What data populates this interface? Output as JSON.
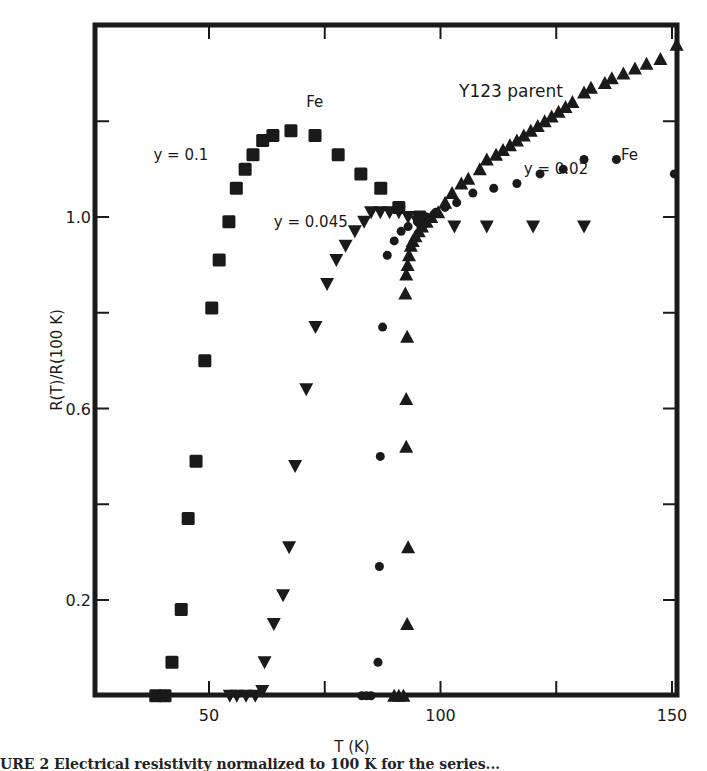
{
  "chart_data": {
    "type": "scatter",
    "title": "",
    "xlabel": "T (K)",
    "xlabel_italic_part": "T",
    "xlabel_unit": "(K)",
    "ylabel": "R(T)/R(100 K)",
    "xlim": [
      25,
      152
    ],
    "ylim": [
      0.0,
      1.45
    ],
    "x_ticks": [
      50,
      75,
      100,
      125,
      150
    ],
    "x_tick_labels": [
      "50",
      "",
      "100",
      "",
      "150"
    ],
    "y_ticks": [
      0.2,
      0.4,
      0.6,
      0.8,
      1.0,
      1.2
    ],
    "y_tick_labels": [
      "0.2",
      "",
      "0.6",
      "",
      "1.0",
      ""
    ],
    "grid": false,
    "legend": "inline annotations",
    "annotations": [
      {
        "text": "Fe",
        "T": 71,
        "R": 1.23
      },
      {
        "text": "y = 0.1",
        "T": 38,
        "R": 1.12
      },
      {
        "text": "y = 0.045",
        "T": 64,
        "R": 0.98
      },
      {
        "text": "Y123 parent",
        "T": 104,
        "R": 1.25
      },
      {
        "text": "y = 0.02",
        "T": 118,
        "R": 1.09
      },
      {
        "text": "Fe",
        "T": 139,
        "R": 1.12
      }
    ],
    "series": [
      {
        "name": "y = 0.1 Fe",
        "marker": "square",
        "points": [
          [
            38.5,
            0.0
          ],
          [
            40.5,
            0.0
          ],
          [
            42.0,
            0.07
          ],
          [
            44.0,
            0.18
          ],
          [
            45.5,
            0.37
          ],
          [
            47.2,
            0.49
          ],
          [
            49.1,
            0.7
          ],
          [
            50.6,
            0.81
          ],
          [
            52.2,
            0.91
          ],
          [
            54.3,
            0.99
          ],
          [
            55.9,
            1.06
          ],
          [
            57.8,
            1.1
          ],
          [
            59.5,
            1.13
          ],
          [
            61.6,
            1.16
          ],
          [
            63.8,
            1.17
          ],
          [
            67.7,
            1.18
          ],
          [
            72.9,
            1.17
          ],
          [
            77.9,
            1.13
          ],
          [
            82.8,
            1.09
          ],
          [
            87.1,
            1.06
          ],
          [
            91.0,
            1.02
          ],
          [
            95.5,
            1.0
          ]
        ]
      },
      {
        "name": "y = 0.045 Fe",
        "marker": "triangle-down",
        "points": [
          [
            54.5,
            0.0
          ],
          [
            56.0,
            0.0
          ],
          [
            58.0,
            0.0
          ],
          [
            60.0,
            0.0
          ],
          [
            61.5,
            0.01
          ],
          [
            62.0,
            0.07
          ],
          [
            64.0,
            0.15
          ],
          [
            66.0,
            0.21
          ],
          [
            67.3,
            0.31
          ],
          [
            68.6,
            0.48
          ],
          [
            71.0,
            0.64
          ],
          [
            73.0,
            0.77
          ],
          [
            75.5,
            0.86
          ],
          [
            77.5,
            0.91
          ],
          [
            79.5,
            0.94
          ],
          [
            81.5,
            0.97
          ],
          [
            83.5,
            0.99
          ],
          [
            85.0,
            1.01
          ],
          [
            87.0,
            1.01
          ],
          [
            89.0,
            1.01
          ],
          [
            91.0,
            1.01
          ],
          [
            93.0,
            1.0
          ],
          [
            95.0,
            0.99
          ],
          [
            97.0,
            0.99
          ],
          [
            103.0,
            0.98
          ],
          [
            110.0,
            0.98
          ],
          [
            120.0,
            0.98
          ],
          [
            131.0,
            0.98
          ]
        ]
      },
      {
        "name": "y = 0.02 Fe",
        "marker": "circle",
        "points": [
          [
            83.0,
            0.0
          ],
          [
            84.0,
            0.0
          ],
          [
            85.0,
            0.0
          ],
          [
            86.5,
            0.07
          ],
          [
            86.8,
            0.27
          ],
          [
            87.0,
            0.5
          ],
          [
            87.5,
            0.77
          ],
          [
            88.5,
            0.92
          ],
          [
            90.0,
            0.95
          ],
          [
            91.5,
            0.97
          ],
          [
            93.0,
            0.98
          ],
          [
            95.0,
            0.99
          ],
          [
            97.0,
            1.0
          ],
          [
            99.0,
            1.01
          ],
          [
            101.0,
            1.02
          ],
          [
            103.5,
            1.03
          ],
          [
            107.0,
            1.05
          ],
          [
            111.5,
            1.06
          ],
          [
            116.5,
            1.07
          ],
          [
            121.5,
            1.09
          ],
          [
            126.5,
            1.1
          ],
          [
            131.0,
            1.12
          ],
          [
            138.0,
            1.12
          ],
          [
            150.5,
            1.09
          ]
        ]
      },
      {
        "name": "Y123 parent",
        "marker": "triangle-up",
        "points": [
          [
            90.0,
            0.0
          ],
          [
            91.0,
            0.0
          ],
          [
            92.0,
            0.0
          ],
          [
            92.8,
            0.15
          ],
          [
            93.0,
            0.31
          ],
          [
            92.6,
            0.52
          ],
          [
            92.6,
            0.62
          ],
          [
            92.8,
            0.75
          ],
          [
            92.4,
            0.84
          ],
          [
            92.6,
            0.88
          ],
          [
            92.9,
            0.9
          ],
          [
            93.2,
            0.92
          ],
          [
            93.6,
            0.94
          ],
          [
            94.0,
            0.95
          ],
          [
            94.6,
            0.96
          ],
          [
            95.3,
            0.97
          ],
          [
            96.0,
            0.98
          ],
          [
            97.0,
            0.99
          ],
          [
            98.0,
            1.0
          ],
          [
            99.5,
            1.01
          ],
          [
            101.0,
            1.03
          ],
          [
            102.5,
            1.05
          ],
          [
            104.5,
            1.07
          ],
          [
            106.0,
            1.08
          ],
          [
            108.5,
            1.1
          ],
          [
            110.0,
            1.12
          ],
          [
            112.0,
            1.13
          ],
          [
            113.5,
            1.14
          ],
          [
            115.0,
            1.15
          ],
          [
            116.5,
            1.16
          ],
          [
            118.0,
            1.17
          ],
          [
            119.5,
            1.18
          ],
          [
            121.0,
            1.19
          ],
          [
            122.5,
            1.2
          ],
          [
            124.0,
            1.21
          ],
          [
            125.5,
            1.22
          ],
          [
            127.0,
            1.23
          ],
          [
            128.5,
            1.24
          ],
          [
            131.0,
            1.26
          ],
          [
            132.5,
            1.27
          ],
          [
            135.5,
            1.28
          ],
          [
            137.0,
            1.29
          ],
          [
            139.5,
            1.3
          ],
          [
            142.0,
            1.31
          ],
          [
            144.5,
            1.32
          ],
          [
            147.5,
            1.33
          ],
          [
            151.0,
            1.36
          ]
        ]
      }
    ]
  },
  "caption": {
    "text": "URE 2    Electrical resistivity normalized to 100 K for the series..."
  },
  "layout": {
    "plot": {
      "left": 95,
      "top": 25,
      "right": 677,
      "bottom": 695
    },
    "x_px": {
      "t0": 50,
      "px0": 209,
      "t1": 150,
      "px1": 672
    },
    "y_px": {
      "r0": 0.2,
      "px0": 600,
      "r1": 1.0,
      "px1": 217
    },
    "ink": "#1a1a1a"
  }
}
